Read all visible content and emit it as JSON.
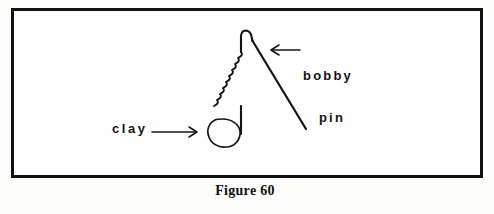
{
  "figure": {
    "caption": "Figure 60",
    "border_color": "#111111",
    "background_color": "#fefefe",
    "ink_color": "#141414"
  },
  "labels": {
    "clay": {
      "text": "clay",
      "arrow_direction": "right",
      "points_to": "clay-blob"
    },
    "bobby_pin": {
      "line1": "bobby",
      "line2": "pin",
      "arrow_direction": "left",
      "points_to": "bobby-pin-right-leg"
    }
  },
  "objects": {
    "clay_blob": {
      "name": "clay",
      "shape": "irregular-blob"
    },
    "bobby_pin": {
      "name": "bobby pin",
      "left_leg": "crimped-wavy-vertical",
      "right_leg": "straight-diagonal",
      "top": "rounded-arch"
    }
  }
}
